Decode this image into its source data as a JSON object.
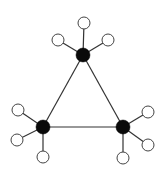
{
  "diagram": {
    "type": "molecular-graph",
    "colors": {
      "hub": "#0a0a0a",
      "leaf": "#ffffff",
      "edge": "#333333"
    },
    "hubs": [
      {
        "id": "top",
        "x": 83,
        "y": 55,
        "r": 7
      },
      {
        "id": "left",
        "x": 43,
        "y": 127,
        "r": 7
      },
      {
        "id": "right",
        "x": 123,
        "y": 127,
        "r": 7
      }
    ],
    "leaves": [
      {
        "hub": "top",
        "x": 84,
        "y": 23,
        "r": 6
      },
      {
        "hub": "top",
        "x": 58,
        "y": 40,
        "r": 6
      },
      {
        "hub": "top",
        "x": 108,
        "y": 40,
        "r": 6
      },
      {
        "hub": "left",
        "x": 18,
        "y": 110,
        "r": 6
      },
      {
        "hub": "left",
        "x": 17,
        "y": 140,
        "r": 6
      },
      {
        "hub": "left",
        "x": 43,
        "y": 157,
        "r": 6
      },
      {
        "hub": "right",
        "x": 148,
        "y": 112,
        "r": 6
      },
      {
        "hub": "right",
        "x": 148,
        "y": 145,
        "r": 6
      },
      {
        "hub": "right",
        "x": 123,
        "y": 158,
        "r": 6
      }
    ],
    "triangle_edges": [
      [
        "top",
        "left"
      ],
      [
        "left",
        "right"
      ],
      [
        "right",
        "top"
      ]
    ]
  }
}
